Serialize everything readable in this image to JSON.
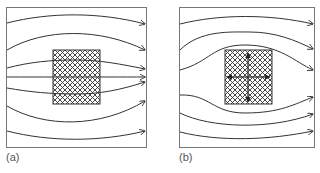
{
  "figure": {
    "panels": [
      {
        "label": "(a)",
        "description": "Uniform field lines passing through a hatched block; lines converge into the block",
        "block_field_arrows": false
      },
      {
        "label": "(b)",
        "description": "Field lines deflected around a hatched block; block contains internal cross arrows",
        "block_field_arrows": true
      }
    ],
    "caption": "",
    "colors": {
      "line": "#333333",
      "frame": "#777777",
      "hatch": "#333333"
    }
  }
}
